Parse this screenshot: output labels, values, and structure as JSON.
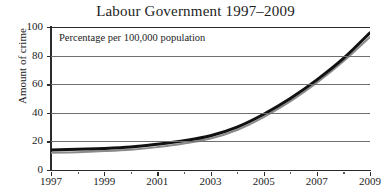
{
  "chart_data": {
    "type": "line",
    "title": "Labour Government 1997–2009",
    "xlabel": "",
    "ylabel": "Amount of crime",
    "annotation": "Percentage per 100,000 population",
    "xlim": [
      1997,
      2009
    ],
    "ylim": [
      0,
      100
    ],
    "grid": true,
    "legend": "none",
    "yticks": [
      0,
      20,
      40,
      60,
      80,
      100
    ],
    "ytick_labels": [
      "0",
      "20",
      "40",
      "60",
      "80",
      "100"
    ],
    "xticks": [
      1997,
      1999,
      2001,
      2003,
      2005,
      2007,
      2009
    ],
    "xtick_labels": [
      "1997",
      "1999",
      "2001",
      "2003",
      "2005",
      "2007",
      "2009"
    ],
    "x_minor_ticks": [
      1998,
      2000,
      2002,
      2004,
      2006,
      2008
    ],
    "x": [
      1997,
      1998,
      1999,
      2000,
      2001,
      2002,
      2003,
      2004,
      2005,
      2006,
      2007,
      2008,
      2009
    ],
    "series": [
      {
        "name": "upper-black-curve",
        "color": "#111111",
        "width": 3.0,
        "values": [
          14,
          14.5,
          15,
          16,
          18,
          20.5,
          24,
          30,
          39,
          50,
          63,
          78,
          96
        ]
      },
      {
        "name": "lower-grey-curve",
        "color": "#8a8a8a",
        "width": 2.0,
        "values": [
          12,
          12.5,
          13.2,
          14.2,
          16,
          18.5,
          22,
          28,
          37,
          48,
          61,
          76,
          93
        ]
      }
    ]
  },
  "colors": {
    "axis": "#2b2b2b",
    "grid": "#6f6f6f",
    "background": "#ffffff",
    "text": "#1d1d1d"
  }
}
